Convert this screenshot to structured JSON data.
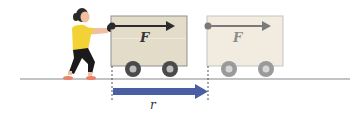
{
  "diagram": {
    "labels": {
      "force_initial": "F",
      "force_final": "F",
      "displacement": "r"
    },
    "colors": {
      "cart_fill": "#e3dcc8",
      "cart_border": "#8f8f8f",
      "cart_ghost_fill": "#f1ecdf",
      "cart_ghost_border": "#c4c4c4",
      "wheel": "#4a4a4a",
      "wheel_hub": "#bdbdbd",
      "wheel_ghost": "#9a9a9a",
      "force_arrow": "#2b2b2b",
      "force_arrow_ghost": "#7a7a7a",
      "displacement_arrow": "#4a5fa3",
      "ground": "#8a8a8a",
      "shirt": "#f2d234",
      "pants": "#1a1a1a",
      "skin": "#f0c0a0",
      "hair": "#2a2a2a",
      "shoes": "#e8826a"
    }
  }
}
